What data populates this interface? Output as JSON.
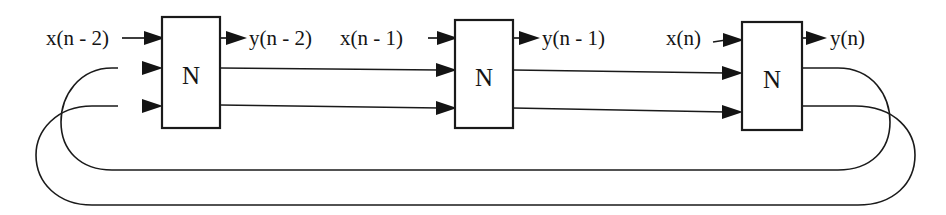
{
  "diagram": {
    "type": "block-diagram",
    "stroke_color": "#1a1a1a",
    "background_color": "#ffffff",
    "blocks": [
      {
        "id": "block-1",
        "label": "N",
        "x": 162,
        "y": 17,
        "width": 58,
        "height": 111
      },
      {
        "id": "block-2",
        "label": "N",
        "x": 455,
        "y": 20,
        "width": 58,
        "height": 108
      },
      {
        "id": "block-3",
        "label": "N",
        "x": 742,
        "y": 22,
        "width": 60,
        "height": 108
      }
    ],
    "signal_labels": [
      {
        "id": "input-1",
        "text": "x(n - 2)",
        "x": 46,
        "y": 45
      },
      {
        "id": "output-1",
        "text": "y(n - 2)",
        "x": 244,
        "y": 45
      },
      {
        "id": "input-2",
        "text": "x(n - 1)",
        "x": 338,
        "y": 45
      },
      {
        "id": "output-2",
        "text": "y(n - 1)",
        "x": 540,
        "y": 45
      },
      {
        "id": "input-3",
        "text": "x(n)",
        "x": 665,
        "y": 45
      },
      {
        "id": "output-3",
        "text": "y(n)",
        "x": 828,
        "y": 45
      }
    ],
    "notes": {
      "stage_count": 3,
      "ports_per_block": 3,
      "feedback_loops": 2,
      "port_rows_y": [
        38,
        68,
        106
      ]
    }
  }
}
